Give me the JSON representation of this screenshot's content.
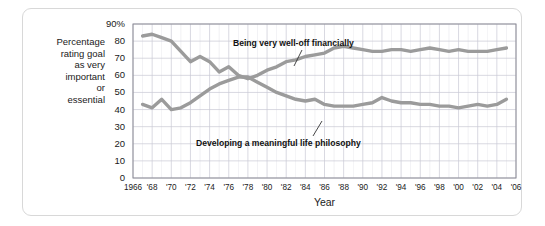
{
  "figure": {
    "background_color": "#ffffff",
    "border_color": "#d8d8d8",
    "grid_color": "#c9c9d4",
    "axis_color": "#8c8c96",
    "line_color": "#9b9b9b",
    "text_color": "#1a1a1a"
  },
  "chart_data": {
    "type": "line",
    "title": "",
    "xlabel": "Year",
    "ylabel": "Percentage rating goal as very important or essential",
    "ylabel_lines": [
      "Percentage",
      "rating goal",
      "as very",
      "important",
      "or",
      "essential"
    ],
    "xlim": [
      1966,
      2006
    ],
    "ylim": [
      0,
      90
    ],
    "grid": true,
    "legend_position": "annotations-on-plot",
    "yticks": [
      0,
      10,
      20,
      30,
      40,
      50,
      60,
      70,
      80,
      90
    ],
    "ytick_labels": [
      "0",
      "10",
      "20",
      "30",
      "40",
      "50",
      "60",
      "70",
      "80",
      "90%"
    ],
    "xticks": [
      1966,
      1968,
      1970,
      1972,
      1974,
      1976,
      1978,
      1980,
      1982,
      1984,
      1986,
      1988,
      1990,
      1992,
      1994,
      1996,
      1998,
      2000,
      2002,
      2004,
      2006
    ],
    "xtick_labels": [
      "1966",
      "'68",
      "'70",
      "'72",
      "'74",
      "'76",
      "'78",
      "'80",
      "'82",
      "'84",
      "'86",
      "'88",
      "'90",
      "'92",
      "'94",
      "'96",
      "'98",
      "'00",
      "'02",
      "'04",
      "'06"
    ],
    "x": [
      1967,
      1968,
      1969,
      1970,
      1971,
      1972,
      1973,
      1974,
      1975,
      1976,
      1977,
      1978,
      1979,
      1980,
      1981,
      1982,
      1983,
      1984,
      1985,
      1986,
      1987,
      1988,
      1989,
      1990,
      1991,
      1992,
      1993,
      1994,
      1995,
      1996,
      1997,
      1998,
      1999,
      2000,
      2001,
      2002,
      2003,
      2004,
      2005
    ],
    "series": [
      {
        "name": "Being very well-off financially",
        "label": "Being very well-off financially",
        "color": "#9b9b9b",
        "values": [
          83,
          84,
          82,
          80,
          74,
          68,
          71,
          68,
          62,
          65,
          60,
          58,
          60,
          63,
          65,
          68,
          69,
          71,
          72,
          73,
          76,
          77,
          76,
          75,
          74,
          74,
          75,
          75,
          74,
          75,
          76,
          75,
          74,
          75,
          74,
          74,
          74,
          75,
          76
        ]
      },
      {
        "name": "Developing a meaningful life philosophy",
        "label": "Developing a meaningful life philosophy",
        "color": "#9b9b9b",
        "values": [
          43,
          41,
          46,
          40,
          41,
          44,
          48,
          52,
          55,
          57,
          59,
          59,
          56,
          53,
          50,
          48,
          46,
          45,
          46,
          43,
          42,
          42,
          42,
          43,
          44,
          47,
          45,
          44,
          44,
          43,
          43,
          42,
          42,
          41,
          42,
          43,
          42,
          43,
          46
        ]
      }
    ],
    "annotations": [
      {
        "text": "Being very well-off financially",
        "series": "Being very well-off financially"
      },
      {
        "text": "Developing a meaningful life philosophy",
        "series": "Developing a meaningful life philosophy"
      }
    ]
  }
}
